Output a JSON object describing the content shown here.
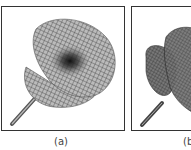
{
  "figure": {
    "panels": [
      {
        "id": "a",
        "caption": "(a)",
        "content": "wireframe mesh 3D surface, trumpet/flower shape on a stem, lighter shading"
      },
      {
        "id": "b",
        "caption": "(b)",
        "content": "wireframe mesh 3D surface, trumpet/flower shape on a stem, darker shading (partially cropped)"
      }
    ]
  }
}
